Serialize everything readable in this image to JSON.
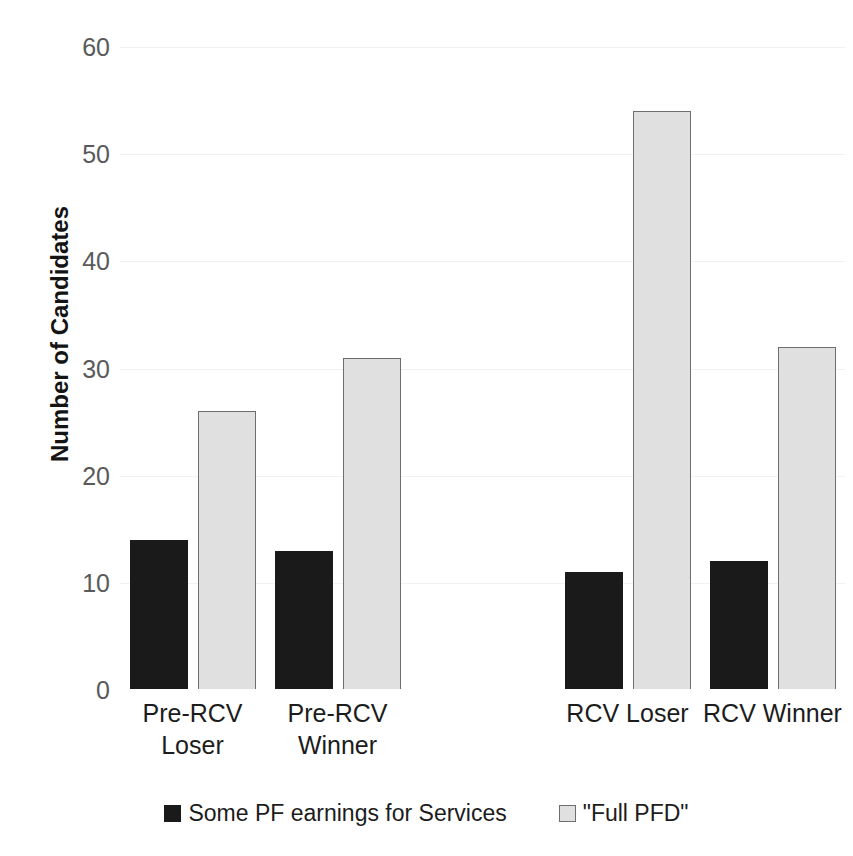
{
  "chart_data": {
    "type": "bar",
    "title": "",
    "subtitle": "",
    "xlabel": "",
    "ylabel": "Number of Candidates",
    "ylim": [
      0,
      60
    ],
    "yticks": [
      0,
      10,
      20,
      30,
      40,
      50,
      60
    ],
    "ytick_labels": [
      "0",
      "10",
      "20",
      "30",
      "40",
      "50",
      "60"
    ],
    "grid": true,
    "grid_axis": "y",
    "legend_position": "bottom-center",
    "categories": [
      "Pre-RCV Loser",
      "Pre-RCV Winner",
      "",
      "RCV Loser",
      "RCV Winner"
    ],
    "category_lines": [
      [
        "Pre-RCV",
        "Loser"
      ],
      [
        "Pre-RCV",
        "Winner"
      ],
      [
        ""
      ],
      [
        "RCV Loser"
      ],
      [
        "RCV Winner"
      ]
    ],
    "series": [
      {
        "name": "Some PF earnings for Services",
        "color": "#1a1a1a",
        "border_color": "#1a1a1a",
        "values": [
          14,
          13,
          null,
          11,
          12
        ]
      },
      {
        "name": "\"Full PFD\"",
        "color": "#e0e0e0",
        "border_color": "#6e6e6e",
        "values": [
          26,
          31,
          null,
          54,
          32
        ]
      }
    ]
  },
  "legend": {
    "items": [
      {
        "label": "Some PF earnings for Services",
        "swatch": "dark"
      },
      {
        "label": "\"Full PFD\"",
        "swatch": "light"
      }
    ]
  }
}
